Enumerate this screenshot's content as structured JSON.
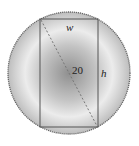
{
  "diagram": {
    "labels": {
      "width": "w",
      "height": "h",
      "diagonal": "20"
    },
    "colors": {
      "circle_center": "#8f8f8f",
      "circle_ring": "#e8e8e8",
      "circle_edge": "#bdbdbd",
      "outline": "#555555",
      "diagonal": "#777777"
    }
  }
}
